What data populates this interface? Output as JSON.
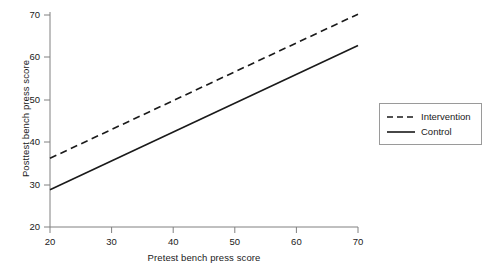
{
  "chart_data": {
    "type": "line",
    "title": "",
    "xlabel": "Pretest bench press score",
    "ylabel": "Posttest bench press score",
    "xlim": [
      20,
      70
    ],
    "ylim": [
      20,
      70
    ],
    "xticks": [
      20,
      30,
      40,
      50,
      60,
      70
    ],
    "yticks": [
      20,
      30,
      40,
      50,
      60,
      70
    ],
    "xtick_labels": [
      "20",
      "30",
      "40",
      "50",
      "60",
      "70"
    ],
    "ytick_labels": [
      "20",
      "30",
      "40",
      "50",
      "60",
      "70"
    ],
    "grid": false,
    "legend_position": "right",
    "x": [
      20,
      70
    ],
    "series": [
      {
        "name": "Intervention",
        "style": "dashed",
        "color": "#1a1a1a",
        "values": [
          36.2,
          70.2
        ]
      },
      {
        "name": "Control",
        "style": "solid",
        "color": "#1a1a1a",
        "values": [
          28.8,
          62.8
        ]
      }
    ]
  },
  "legend": {
    "entries": [
      {
        "label": "Intervention",
        "style": "dashed"
      },
      {
        "label": "Control",
        "style": "solid"
      }
    ]
  },
  "colors": {
    "line": "#1a1a1a",
    "axis": "#808080",
    "legend_border": "#9a9a9a",
    "background": "#ffffff"
  }
}
